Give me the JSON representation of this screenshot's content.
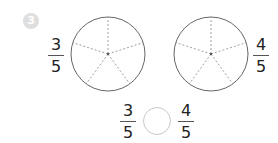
{
  "problem": {
    "number": "3",
    "badge_color": "#dedede",
    "left_pie": {
      "label": {
        "numerator": "3",
        "denominator": "5"
      },
      "slices": 5,
      "shaded": 0
    },
    "right_pie": {
      "label": {
        "numerator": "4",
        "denominator": "5"
      },
      "slices": 5,
      "shaded": 0
    },
    "comparison": {
      "left": {
        "numerator": "3",
        "denominator": "5"
      },
      "answer_blank": "",
      "right": {
        "numerator": "4",
        "denominator": "5"
      }
    }
  }
}
